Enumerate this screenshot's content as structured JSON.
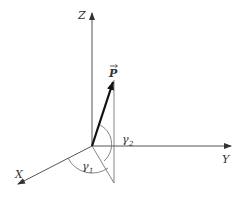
{
  "diagram": {
    "title": "",
    "colors": {
      "axis": "#555555",
      "vector": "#111111",
      "label": "#333333",
      "background": "#ffffff"
    },
    "origin": {
      "x": 92,
      "y": 146
    },
    "axes": [
      {
        "name": "Z",
        "label": "Z",
        "end": {
          "x": 92,
          "y": 12
        },
        "label_pos": {
          "x": 78,
          "y": 19
        }
      },
      {
        "name": "Y",
        "label": "Y",
        "end": {
          "x": 232,
          "y": 146
        },
        "label_pos": {
          "x": 222,
          "y": 163
        }
      },
      {
        "name": "X",
        "label": "X",
        "end": {
          "x": 17,
          "y": 185
        },
        "label_pos": {
          "x": 16,
          "y": 178
        }
      }
    ],
    "vector": {
      "label": "P",
      "end": {
        "x": 114,
        "y": 80
      },
      "label_pos": {
        "x": 109,
        "y": 76
      }
    },
    "projection_lines": [
      {
        "from": {
          "x": 114,
          "y": 80
        },
        "to": {
          "x": 114,
          "y": 183
        }
      },
      {
        "from": {
          "x": 92,
          "y": 146
        },
        "to": {
          "x": 114,
          "y": 183
        }
      }
    ],
    "angles": [
      {
        "name": "gamma1",
        "label": "γ",
        "subscript": "1",
        "label_pos": {
          "x": 83,
          "y": 170
        }
      },
      {
        "name": "gamma2",
        "label": "γ",
        "subscript": "2",
        "label_pos": {
          "x": 122,
          "y": 142
        }
      }
    ]
  }
}
